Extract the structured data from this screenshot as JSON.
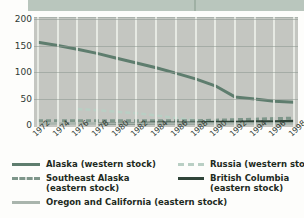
{
  "page": {
    "background_color": "#fdfdfb",
    "header_band_color": "#b9c6bd"
  },
  "chart_data": {
    "type": "line",
    "title": "",
    "subtitle": "",
    "xlabel": "",
    "ylabel": "",
    "ylim": [
      0,
      200
    ],
    "yticks": [
      0,
      50,
      100,
      150,
      200
    ],
    "xlim": [
      1972,
      1998
    ],
    "x": [
      1972,
      1974,
      1976,
      1978,
      1980,
      1982,
      1984,
      1986,
      1988,
      1990,
      1992,
      1994,
      1996,
      1998
    ],
    "xticks": [
      "1972",
      "1974",
      "1976",
      "1978",
      "1980",
      "1982",
      "1984",
      "1986",
      "1988",
      "1990",
      "1992",
      "1994",
      "1996",
      "1998"
    ],
    "grid": "vertical-white-horizontal-grey",
    "legend_position": "below",
    "plot_background": "#c4c6c1",
    "series": [
      {
        "name": "Alaska (western stock)",
        "color": "#5e7d6e",
        "style": "solid",
        "width": 3,
        "values": [
          156,
          150,
          143,
          135,
          126,
          117,
          108,
          98,
          87,
          74,
          53,
          49,
          45,
          43
        ]
      },
      {
        "name": "Russia (western stock)",
        "color": "#b9cfc4",
        "style": "dashed",
        "width": 2.5,
        "values": [
          null,
          null,
          30,
          28,
          25,
          22,
          18,
          13,
          9,
          7,
          6,
          6,
          7,
          8
        ]
      },
      {
        "name": "Southeast Alaska (eastern stock)",
        "color": "#7e968a",
        "style": "dashed",
        "width": 3,
        "values": [
          8,
          8,
          8,
          8,
          8,
          8,
          8,
          8,
          8,
          9,
          10,
          11,
          12,
          13
        ]
      },
      {
        "name": "British Columbia (eastern stock)",
        "color": "#2f4438",
        "style": "solid",
        "width": 3,
        "values": [
          null,
          null,
          null,
          3,
          3,
          3,
          4,
          4,
          4,
          5,
          5,
          6,
          6,
          7
        ]
      },
      {
        "name": "Oregon and California (eastern stock)",
        "color": "#a9b5ad",
        "style": "solid",
        "width": 2.5,
        "values": [
          3,
          3,
          3,
          3,
          3,
          3,
          3,
          3,
          3,
          3,
          3,
          3,
          3,
          3
        ]
      }
    ]
  },
  "legend": {
    "entries": [
      {
        "label": "Alaska (western stock)",
        "label2": "",
        "color": "#5e7d6e",
        "style": "solid"
      },
      {
        "label": "Russia (western stock)",
        "label2": "",
        "color": "#b9cfc4",
        "style": "dashed"
      },
      {
        "label": "Southeast Alaska",
        "label2": "(eastern stock)",
        "color": "#7e968a",
        "style": "dashed"
      },
      {
        "label": "British Columbia",
        "label2": "(eastern stock)",
        "color": "#2f4438",
        "style": "solid"
      },
      {
        "label": "Oregon and California (eastern stock)",
        "label2": "",
        "color": "#a9b5ad",
        "style": "solid"
      }
    ]
  }
}
